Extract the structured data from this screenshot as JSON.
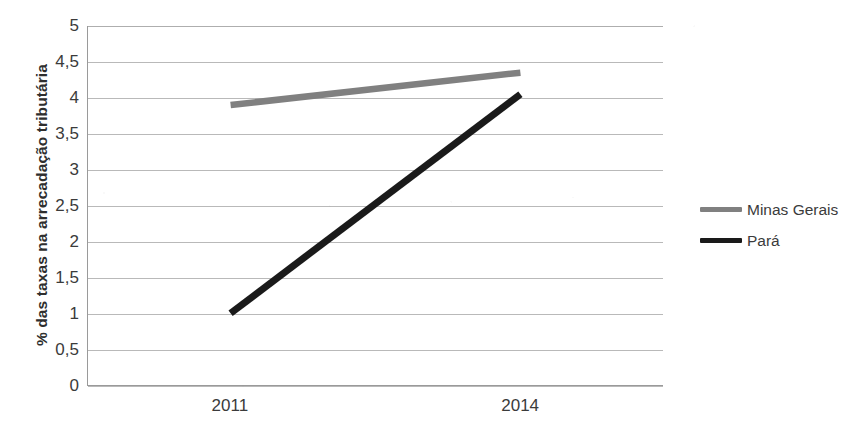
{
  "chart_data": {
    "type": "line",
    "title": "",
    "xlabel": "",
    "ylabel": "% das taxas na arrecadação tributária",
    "categories": [
      "2011",
      "2014"
    ],
    "x": [
      2011,
      2014
    ],
    "series": [
      {
        "name": "Minas Gerais",
        "values": [
          3.9,
          4.35
        ],
        "color": "#808080"
      },
      {
        "name": "Pará",
        "values": [
          1.0,
          4.05
        ],
        "color": "#1a1a1a"
      }
    ],
    "ylim": [
      0,
      5
    ],
    "ytick_labels": [
      "0",
      "0,5",
      "1",
      "1,5",
      "2",
      "2,5",
      "3",
      "3,5",
      "4",
      "4,5",
      "5"
    ],
    "ytick_values": [
      0,
      0.5,
      1,
      1.5,
      2,
      2.5,
      3,
      3.5,
      4,
      4.5,
      5
    ],
    "grid": "horizontal",
    "legend_position": "right",
    "legend_entries": [
      "Minas Gerais",
      "Pará"
    ]
  },
  "axes": {
    "y_title": "% das taxas na arrecadação tributária"
  },
  "colors": {
    "minas_gerais": "#808080",
    "para": "#1a1a1a",
    "gridline": "#b9b9b9",
    "axis": "#9a9a9a",
    "text": "#3b3b3b",
    "background": "#ffffff"
  }
}
